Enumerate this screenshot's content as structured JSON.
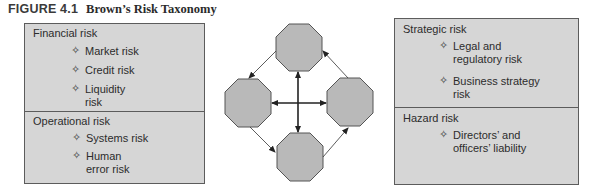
{
  "figure": {
    "number": "FIGURE 4.1",
    "title": "Brown’s Risk Taxonomy"
  },
  "left_panel": {
    "sections": [
      {
        "title": "Financial risk",
        "items": [
          "Market risk",
          "Credit risk",
          "Liquidity\nrisk"
        ]
      },
      {
        "title": "Operational risk",
        "items": [
          "Systems risk",
          "Human\nerror risk"
        ]
      }
    ]
  },
  "right_panel": {
    "sections": [
      {
        "title": "Strategic risk",
        "items": [
          "Legal and\nregulatory risk",
          "Business strategy\nrisk"
        ]
      },
      {
        "title": "Hazard risk",
        "items": [
          "Directors’ and\nofficers’ liability"
        ]
      }
    ]
  },
  "bullet_glyph": "✧",
  "center_diagram": {
    "nodes": [
      "top",
      "left",
      "right",
      "bottom"
    ],
    "node_fill": "#b8b8b8",
    "node_stroke": "#555555",
    "cycle_arrows": [
      "top→left",
      "left→bottom",
      "bottom→right",
      "right→top"
    ],
    "cross_arrows": [
      "left↔right",
      "top↔bottom"
    ]
  },
  "colors": {
    "panel_fill": "#d6d6d6",
    "panel_border": "#5c5c5c",
    "text": "#2c2c2c"
  }
}
